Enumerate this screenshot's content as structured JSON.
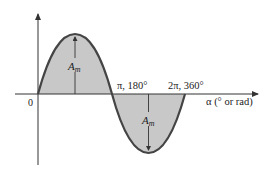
{
  "diagram": {
    "origin_label": "0",
    "half_cycle_label": "π, 180°",
    "full_cycle_label": "2π, 360°",
    "x_axis_label": "α (° or rad)",
    "amplitude_label_positive": "A",
    "amplitude_label_positive_sub": "m",
    "amplitude_label_negative": "A",
    "amplitude_label_negative_sub": "m",
    "colors": {
      "curve": "#444444",
      "fill": "#c8c8c8",
      "axis": "#333333"
    }
  }
}
